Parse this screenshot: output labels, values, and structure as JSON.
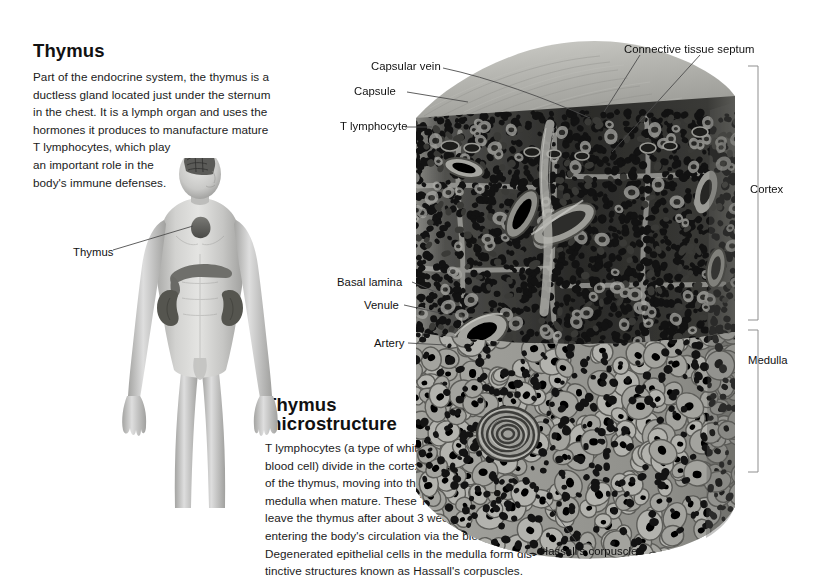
{
  "figure": {
    "title": "Thymus",
    "type": "anatomical-illustration"
  },
  "intro": {
    "heading": "Thymus",
    "lines": [
      "Part of the endocrine system, the thymus is a",
      "ductless gland located just under the sternum",
      "in the chest. It is a lymph organ and uses the",
      "hormones it produces to manufacture mature",
      "T lymphocytes, which play",
      "an important role in the",
      "body's immune defenses."
    ]
  },
  "microstructure": {
    "heading_line1": "Thymus",
    "heading_line2": "microstructure",
    "lines": [
      "T lymphocytes (a type of white",
      "blood cell) divide in the cortex",
      "of the thymus, moving into the",
      "medulla when mature. These T cells",
      "leave the thymus after about 3 weeks,",
      "entering the body's circulation via the blood vessels.",
      "Degenerated epithelial cells in the medulla form dis-",
      "tinctive structures known as Hassall's corpuscles."
    ]
  },
  "labels": {
    "thymus_organ": "Thymus",
    "capsular_vein": "Capsular vein",
    "capsule": "Capsule",
    "t_lymphocyte": "T lymphocyte",
    "connective_tissue_septum": "Connective tissue septum",
    "basal_lamina": "Basal lamina",
    "venule": "Venule",
    "artery": "Artery",
    "hassalls_corpuscle": "Hassall's corpuscle"
  },
  "brackets": {
    "cortex": "Cortex",
    "medulla": "Medulla"
  },
  "colors": {
    "background": "#ffffff",
    "text": "#111111",
    "leader_line": "#4a4a4a",
    "bracket_line": "#8c8c8c",
    "capsule_light": "#b9b9b4",
    "capsule_top": "#a8a8a2",
    "cortex_dark": "#1d1d1d",
    "medulla_mid": "#8f8f8a",
    "skin_light": "#d8d8d6",
    "skin_mid": "#b4b4b2",
    "organ_dark": "#5d5d5a"
  }
}
